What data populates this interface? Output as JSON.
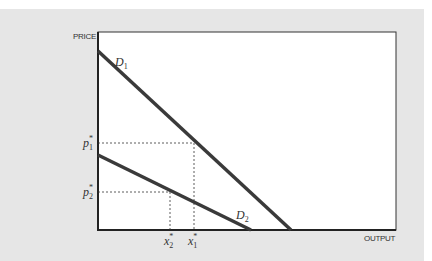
{
  "diagram": {
    "y_axis_label": "PRICE",
    "x_axis_label": "OUTPUT",
    "curves": [
      {
        "name": "D",
        "subscript": "1"
      },
      {
        "name": "D",
        "subscript": "2"
      }
    ],
    "price_levels": [
      {
        "name": "p",
        "subscript": "1",
        "superscript": "*"
      },
      {
        "name": "p",
        "subscript": "2",
        "superscript": "*"
      }
    ],
    "quantity_levels": [
      {
        "name": "x",
        "subscript": "2",
        "superscript": "*"
      },
      {
        "name": "x",
        "subscript": "1",
        "superscript": "*"
      }
    ],
    "colors": {
      "background": "#e6e6e6",
      "plot": "#ffffff",
      "curve": "#3a3a3a",
      "axis": "#222222"
    }
  }
}
